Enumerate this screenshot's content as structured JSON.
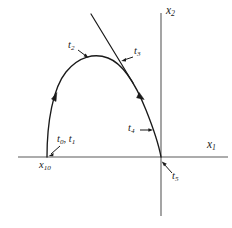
{
  "figure": {
    "type": "phase-plane-trajectory-diagram",
    "background_color": "#ffffff",
    "stroke_color": "#1a1a1a",
    "axis_color": "#555555"
  },
  "axes": {
    "horizontal": {
      "name": "x1-axis",
      "label_main": "x",
      "label_sub": "1",
      "y_pixel": 157,
      "x_start": 18,
      "x_end": 228
    },
    "vertical": {
      "name": "x2-axis",
      "label_main": "x",
      "label_sub": "2",
      "x_pixel": 161,
      "y_start": 13,
      "y_end": 216
    }
  },
  "curve": {
    "name": "trajectory-arc",
    "description": "arc rising from x-axis to apex then descending to origin",
    "start_point": [
      47,
      157
    ],
    "apex_point": [
      105,
      57
    ],
    "end_point": [
      161,
      157
    ],
    "direction_markers": 2
  },
  "tangent_line": {
    "name": "tangent-line",
    "start_point": [
      91,
      14
    ],
    "end_point": [
      133,
      83
    ]
  },
  "labels": {
    "x2_axis": {
      "main": "x",
      "sub": "2"
    },
    "x1_axis": {
      "main": "x",
      "sub": "1"
    },
    "t0_t1": {
      "text": "t",
      "sub0": "0",
      "sep": ", ",
      "text1": "t",
      "sub1": "1"
    },
    "t2": {
      "main": "t",
      "sub": "2"
    },
    "t3": {
      "main": "t",
      "sub": "3"
    },
    "t4": {
      "main": "t",
      "sub": "4"
    },
    "t5": {
      "main": "t",
      "sub": "5"
    },
    "x10": {
      "main": "x",
      "sub": "10"
    }
  }
}
